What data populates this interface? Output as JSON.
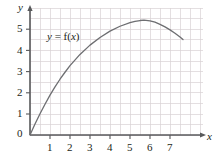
{
  "chart_data": {
    "type": "line",
    "title": "",
    "xlabel": "x",
    "ylabel": "y",
    "xlim": [
      0,
      7.75
    ],
    "ylim": [
      0,
      5.85
    ],
    "grid": true,
    "grid_step": 0.5,
    "legend": "none",
    "annotations": [
      {
        "text": "y = f(x)",
        "x": 1.0,
        "y": 4.6,
        "italic_parts": [
          "y",
          "x"
        ]
      }
    ],
    "xticks": [
      0,
      1,
      2,
      3,
      4,
      5,
      6,
      7
    ],
    "xticklabels": [
      "0",
      "1",
      "2",
      "3",
      "4",
      "5",
      "6",
      "7"
    ],
    "yticks": [
      0,
      1,
      2,
      3,
      4,
      5
    ],
    "yticklabels": [
      "0",
      "1",
      "2",
      "3",
      "4",
      "5"
    ],
    "series": [
      {
        "name": "f(x)",
        "color": "#6d6e71",
        "x": [
          0,
          0.25,
          0.5,
          0.75,
          1.0,
          1.25,
          1.5,
          1.75,
          2.0,
          2.5,
          3.0,
          3.5,
          4.0,
          4.5,
          5.0,
          5.25,
          5.5,
          5.7,
          6.0,
          6.25,
          6.5,
          6.75,
          7.0,
          7.25,
          7.5,
          7.65
        ],
        "y": [
          0,
          0.52,
          1.0,
          1.45,
          1.88,
          2.27,
          2.63,
          2.96,
          3.27,
          3.8,
          4.24,
          4.6,
          4.9,
          5.13,
          5.3,
          5.36,
          5.4,
          5.42,
          5.38,
          5.32,
          5.22,
          5.1,
          4.96,
          4.8,
          4.62,
          4.5
        ]
      }
    ]
  },
  "axis_labels": {
    "x_axis_name": "x",
    "y_axis_name": "y"
  },
  "colors": {
    "curve": "#6d6e71",
    "axis": "#58595b",
    "grid": "#d9d2d4",
    "text": "#231f20",
    "background": "#ffffff"
  },
  "annotation_text": {
    "lhs": "y",
    "equals": " = f(",
    "var": "x",
    "close": ")"
  }
}
